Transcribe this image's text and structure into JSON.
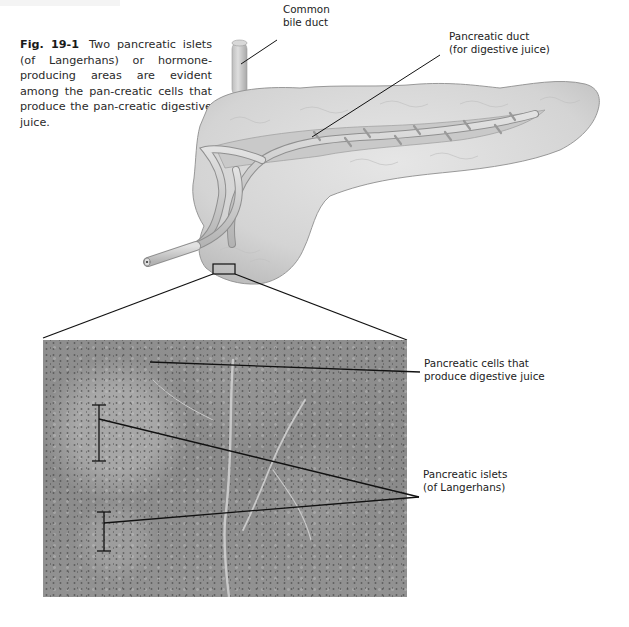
{
  "page": {
    "header_text": ""
  },
  "caption": {
    "figure_number": "Fig. 19-1",
    "text": "Two pancreatic islets (of Langerhans) or hormone-producing areas are evident among the pan-creatic cells that produce the pan-creatic digestive juice."
  },
  "labels": {
    "common_bile_duct": [
      "Common",
      "bile duct"
    ],
    "pancreatic_duct": [
      "Pancreatic duct",
      "(for digestive juice)"
    ],
    "pancreatic_cells": [
      "Pancreatic cells that",
      "produce digestive juice"
    ],
    "pancreatic_islets": [
      "Pancreatic islets",
      "(of Langerhans)"
    ]
  },
  "illustration": {
    "organ": "pancreas",
    "inset": "micrograph of pancreatic tissue",
    "colors": {
      "tissue": "#d9d9d9",
      "tissue_shadow": "#b8b8b8",
      "duct": "#c8c8c8",
      "micrograph": "#8c8c8c",
      "leader_line": "#111111"
    }
  }
}
